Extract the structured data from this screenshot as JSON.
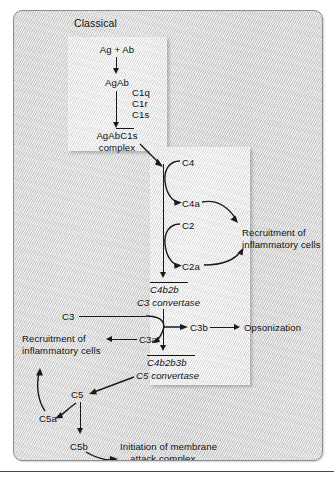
{
  "figure": {
    "panel_label": "Classical"
  },
  "colors": {
    "panel_bg": "#d6d6d6",
    "subbox_bg": "#e8e8e8",
    "stroke": "#1a1a1a",
    "text": "#121212",
    "rule": "#4a4a4a"
  },
  "nodes": {
    "ag_ab": "Ag + Ab",
    "agab": "AgAb",
    "c1q": "C1q",
    "c1r": "C1r",
    "c1s": "C1s",
    "agabc1s": "AgAbC1s",
    "complex": "complex",
    "c4": "C4",
    "c4a": "C4a",
    "c2": "C2",
    "c2a": "C2a",
    "c4b2b": "C4b2b",
    "c3_convertase": "C3 convertase",
    "c3": "C3",
    "c3a": "C3a",
    "c3b": "C3b",
    "c4b2b3b": "C4b2b3b",
    "c5_convertase": "C5 convertase",
    "c5": "C5",
    "c5a": "C5a",
    "c5b": "C5b"
  },
  "outcomes": {
    "recruit_right_line1": "Recruitment of",
    "recruit_right_line2": "inflammatory cells",
    "recruit_left_line1": "Recruitment of",
    "recruit_left_line2": "inflammatory cells",
    "opsonization": "Opsonization",
    "mac_line1": "Initiation of membrane",
    "mac_line2": "attack complex"
  },
  "diagram_data": {
    "type": "flow-diagram",
    "pathway": "Classical complement pathway",
    "edges": [
      {
        "from": "Ag + Ab",
        "to": "AgAb",
        "style": "straight-down"
      },
      {
        "from": "AgAb",
        "to": "AgAbC1s complex",
        "style": "straight-down",
        "cofactors": [
          "C1q",
          "C1r",
          "C1s"
        ]
      },
      {
        "from": "AgAbC1s complex",
        "to": "C4/C2 cascade",
        "style": "diagonal"
      },
      {
        "from": "C4",
        "to": "C4a",
        "style": "curved"
      },
      {
        "from": "C4a",
        "to": "Recruitment of inflammatory cells",
        "style": "curved"
      },
      {
        "from": "C2",
        "to": "C2a",
        "style": "curved"
      },
      {
        "from": "C2a",
        "to": "Recruitment of inflammatory cells",
        "style": "curved"
      },
      {
        "from": "C4 + C2 cascade",
        "to": "C4b2b (C3 convertase)",
        "style": "straight-down"
      },
      {
        "from": "C3",
        "to": "C3b",
        "style": "curved"
      },
      {
        "from": "C3",
        "to": "C3a",
        "style": "curved"
      },
      {
        "from": "C3a",
        "to": "Recruitment of inflammatory cells",
        "style": "straight-left"
      },
      {
        "from": "C3b",
        "to": "Opsonization",
        "style": "straight-right"
      },
      {
        "from": "C4b2b",
        "to": "C4b2b3b (C5 convertase)",
        "style": "straight-down"
      },
      {
        "from": "C4b2b3b (C5 convertase)",
        "to": "C5",
        "style": "diagonal"
      },
      {
        "from": "C5",
        "to": "C5a",
        "style": "curved"
      },
      {
        "from": "C5a",
        "to": "Recruitment of inflammatory cells",
        "style": "curved"
      },
      {
        "from": "C5",
        "to": "C5b",
        "style": "straight-down"
      },
      {
        "from": "C5b",
        "to": "Initiation of membrane attack complex",
        "style": "curved"
      }
    ]
  }
}
